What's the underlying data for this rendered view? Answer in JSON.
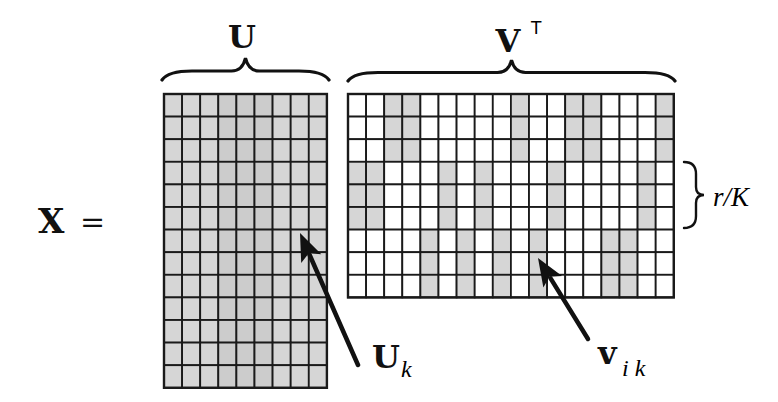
{
  "diagram": {
    "lhs": {
      "symbol": "X",
      "equals": "="
    },
    "colors": {
      "stroke": "#1a1a1a",
      "shaded": "#d6d6d6",
      "shaded_mid": "#cccccc",
      "empty": "#ffffff",
      "ink": "#111111"
    },
    "U": {
      "label": "U",
      "rows": 13,
      "cols": 9,
      "x": 164,
      "y": 94,
      "cell_w": 18.1,
      "cell_h": 22.6,
      "fill": "all-shaded",
      "darker_cols": [
        3,
        4,
        5
      ],
      "brace": {
        "x1": 162,
        "x2": 329,
        "y_top": 58,
        "y_bot": 80
      },
      "arrow": {
        "from": [
          358,
          365
        ],
        "to": [
          300,
          233
        ]
      },
      "annotation": {
        "main": "U",
        "sub": "k"
      }
    },
    "VT": {
      "label": "V",
      "superscript": "T",
      "rows": 9,
      "cols": 18,
      "x": 348,
      "y": 94,
      "cell_w": 18.1,
      "cell_h": 22.6,
      "row_groups": [
        {
          "rows": [
            0,
            1,
            2
          ],
          "shaded_cols": [
            2,
            3,
            9,
            12,
            13,
            17
          ]
        },
        {
          "rows": [
            3,
            4,
            5
          ],
          "shaded_cols": [
            0,
            1,
            5,
            7,
            11,
            16
          ]
        },
        {
          "rows": [
            6,
            7,
            8
          ],
          "shaded_cols": [
            4,
            6,
            8,
            10,
            14,
            15
          ]
        }
      ],
      "brace": {
        "x1": 348,
        "x2": 675,
        "y_top": 60,
        "y_bot": 81
      },
      "arrow": {
        "from": [
          588,
          339
        ],
        "to": [
          538,
          258
        ]
      },
      "annotation": {
        "main": "v",
        "sub": "i k"
      }
    },
    "group_brace": {
      "label": "r/K",
      "y1": 162,
      "y2": 228,
      "x": 690
    }
  }
}
